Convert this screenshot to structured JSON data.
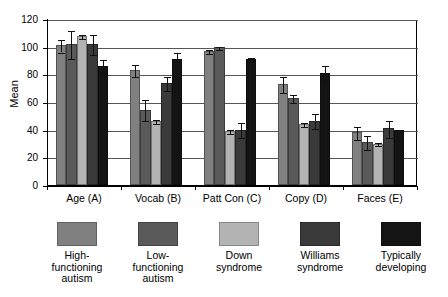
{
  "chart_data": {
    "type": "bar",
    "title": "",
    "xlabel": "",
    "ylabel": "Mean",
    "ylim": [
      0,
      120
    ],
    "yticks": [
      0,
      20,
      40,
      60,
      80,
      100,
      120
    ],
    "grid": true,
    "legend_position": "below",
    "error_bars": "standard error",
    "categories": [
      "Age (A)",
      "Vocab (B)",
      "Patt Con (C)",
      "Copy (D)",
      "Faces (E)"
    ],
    "series": [
      {
        "name": "High-functioning autism",
        "color": "#808080",
        "values": [
          101,
          83,
          97,
          73,
          38
        ],
        "errors": [
          4.5,
          4.5,
          1.5,
          5.5,
          4.5
        ]
      },
      {
        "name": "Low-functioning autism",
        "color": "#5a5a5a",
        "values": [
          102,
          54.5,
          99.5,
          63,
          31
        ],
        "errors": [
          10,
          7.5,
          1,
          3,
          5
        ]
      },
      {
        "name": "Down syndrome",
        "color": "#b3b3b3",
        "values": [
          108,
          46,
          39,
          44,
          30
        ],
        "errors": [
          1.5,
          1.5,
          1.5,
          1.5,
          1
        ]
      },
      {
        "name": "Williams syndrome",
        "color": "#3a3a3a",
        "values": [
          102,
          74,
          40,
          46.5,
          41
        ],
        "errors": [
          7.5,
          5,
          5.5,
          5.5,
          6
        ]
      },
      {
        "name": "Typically developing",
        "color": "#141414",
        "values": [
          86,
          91,
          91,
          81,
          40
        ],
        "errors": [
          5,
          5,
          1.5,
          5.5,
          0
        ]
      }
    ]
  },
  "axis": {
    "y_title": "Mean",
    "y_tick_labels": [
      "0",
      "20",
      "40",
      "60",
      "80",
      "100",
      "120"
    ],
    "x_tick_labels": [
      "Age (A)",
      "Vocab (B)",
      "Patt Con (C)",
      "Copy (D)",
      "Faces (E)"
    ]
  },
  "legend": {
    "items": [
      {
        "label": "High-\nfunctioning\nautism",
        "color": "#808080"
      },
      {
        "label": "Low-\nfunctioning\nautism",
        "color": "#5a5a5a"
      },
      {
        "label": "Down\nsyndrome",
        "color": "#b3b3b3"
      },
      {
        "label": "Williams\nsyndrome",
        "color": "#3a3a3a"
      },
      {
        "label": "Typically\ndeveloping",
        "color": "#141414"
      }
    ]
  }
}
